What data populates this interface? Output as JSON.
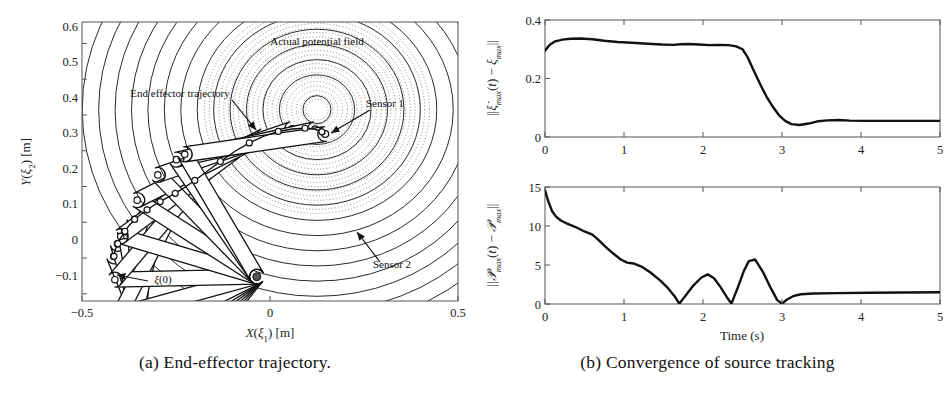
{
  "figure": {
    "panels": [
      {
        "id": "a",
        "caption": "(a)  End-effector trajectory.",
        "chart_index": 0
      },
      {
        "id": "b",
        "caption": "(b)  Convergence of source tracking",
        "chart_index": 1
      }
    ]
  },
  "chart_data": [
    {
      "type": "line",
      "title": "",
      "subtitle": "",
      "xlabel": "X(ξ₁) [m]",
      "ylabel": "Y(ξ₂) [m]",
      "xlim": [
        -0.5,
        0.5
      ],
      "ylim": [
        -0.12,
        0.66
      ],
      "grid": false,
      "legend_position": "none",
      "xticks": [
        -0.5,
        0,
        0.5
      ],
      "xticklabels": [
        "−0.5",
        "0",
        "0.5"
      ],
      "yticks": [
        -0.1,
        0,
        0.1,
        0.2,
        0.3,
        0.4,
        0.5,
        0.6
      ],
      "yticklabels": [
        "−0.1",
        "0",
        "0.1",
        "0.2",
        "0.3",
        "0.4",
        "0.5",
        "0.6"
      ],
      "annotations": [
        {
          "text": "Actual potential field",
          "x": 0.19,
          "y": 0.605
        },
        {
          "text": "End effector trajectory",
          "x": -0.295,
          "y": 0.465
        },
        {
          "text": "Sensor 1",
          "x": 0.175,
          "y": 0.385
        },
        {
          "text": "Sensor 2",
          "x": 0.185,
          "y": 0.075
        },
        {
          "text": "ξ(0)",
          "x": -0.315,
          "y": 0.012
        }
      ],
      "potential_field": {
        "center": [
          0.125,
          0.415
        ],
        "kind": "concentric-contours",
        "n_solid_rings": 13,
        "n_dotted_rings": 22
      },
      "manipulator": {
        "kind": "two-link-planar-snapshots",
        "base": [
          -0.035,
          -0.052
        ],
        "n_snapshots": 13
      },
      "series": [
        {
          "name": "end-effector trajectory",
          "x": [
            -0.415,
            -0.412,
            -0.405,
            -0.396,
            -0.386,
            -0.374,
            -0.36,
            -0.344,
            -0.327,
            -0.31,
            -0.292,
            -0.273,
            -0.252,
            -0.228,
            -0.2,
            -0.168,
            -0.132,
            -0.094,
            -0.055,
            -0.016,
            0.022,
            0.059,
            0.093,
            0.12,
            0.138,
            0.147
          ],
          "y": [
            0.005,
            0.022,
            0.04,
            0.058,
            0.075,
            0.092,
            0.108,
            0.122,
            0.135,
            0.147,
            0.158,
            0.169,
            0.181,
            0.197,
            0.217,
            0.242,
            0.27,
            0.298,
            0.322,
            0.341,
            0.354,
            0.361,
            0.363,
            0.36,
            0.353,
            0.347
          ]
        }
      ]
    },
    {
      "type": "line",
      "title": "",
      "subtitle": "",
      "xlabel": "Time (s)",
      "shared_x": true,
      "grid": false,
      "legend_position": "none",
      "subplots": [
        {
          "ylabel": "||ξ̇ₘₐₓ(t) − ξₘₐₓ||",
          "ylabel_parts": {
            "norm_open": "||",
            "dot_var": "ẞ",
            "var1": "ξ",
            "sub1": "max",
            "arg": "(t)",
            "minus": "−",
            "var2": "ξ",
            "sub2": "max",
            "norm_close": "||"
          },
          "xlim": [
            0,
            5
          ],
          "ylim": [
            0,
            0.4
          ],
          "xticks": [
            0,
            1,
            2,
            3,
            4,
            5
          ],
          "xticklabels": [
            "0",
            "1",
            "2",
            "3",
            "4",
            "5"
          ],
          "yticks": [
            0,
            0.2,
            0.4
          ],
          "yticklabels": [
            "0",
            "0.2",
            "0.4"
          ],
          "x": [
            0.0,
            0.06,
            0.13,
            0.22,
            0.32,
            0.45,
            0.6,
            0.75,
            0.92,
            1.1,
            1.3,
            1.48,
            1.62,
            1.72,
            1.82,
            1.95,
            2.08,
            2.2,
            2.32,
            2.42,
            2.5,
            2.56,
            2.62,
            2.68,
            2.74,
            2.8,
            2.88,
            2.96,
            3.04,
            3.12,
            3.22,
            3.34,
            3.46,
            3.58,
            3.72,
            3.86,
            4.05,
            4.3,
            4.6,
            5.0
          ],
          "y": [
            0.295,
            0.315,
            0.327,
            0.333,
            0.336,
            0.337,
            0.334,
            0.329,
            0.325,
            0.322,
            0.319,
            0.316,
            0.315,
            0.317,
            0.318,
            0.316,
            0.314,
            0.315,
            0.314,
            0.31,
            0.3,
            0.275,
            0.24,
            0.205,
            0.172,
            0.14,
            0.105,
            0.075,
            0.055,
            0.044,
            0.041,
            0.046,
            0.054,
            0.057,
            0.058,
            0.056,
            0.055,
            0.055,
            0.055,
            0.055
          ]
        },
        {
          "ylabel": "||𝒯̇ₘₐₓ(t) − 𝒯ₘₐₓ||",
          "ylabel_parts": {
            "norm_open": "||",
            "var1": "𝒯",
            "sub1": "max",
            "arg": "(t)",
            "minus": "−",
            "var2": "𝒯",
            "sub2": "max",
            "norm_close": "||"
          },
          "xlim": [
            0,
            5
          ],
          "ylim": [
            0,
            15
          ],
          "xticks": [
            0,
            1,
            2,
            3,
            4,
            5
          ],
          "xticklabels": [
            "0",
            "1",
            "2",
            "3",
            "4",
            "5"
          ],
          "yticks": [
            0,
            5,
            10,
            15
          ],
          "yticklabels": [
            "0",
            "5",
            "10",
            "15"
          ],
          "x": [
            0.0,
            0.04,
            0.09,
            0.14,
            0.2,
            0.28,
            0.38,
            0.5,
            0.6,
            0.68,
            0.76,
            0.86,
            0.96,
            1.04,
            1.12,
            1.22,
            1.34,
            1.46,
            1.56,
            1.64,
            1.7,
            1.78,
            1.88,
            1.98,
            2.06,
            2.14,
            2.22,
            2.3,
            2.36,
            2.44,
            2.52,
            2.58,
            2.66,
            2.76,
            2.86,
            2.94,
            3.0,
            3.06,
            3.14,
            3.24,
            3.4,
            3.7,
            4.1,
            4.55,
            5.0
          ],
          "y": [
            14.6,
            13.2,
            11.9,
            11.2,
            10.7,
            10.3,
            9.9,
            9.3,
            8.9,
            8.2,
            7.4,
            6.5,
            5.7,
            5.3,
            5.2,
            4.8,
            4.0,
            3.0,
            2.0,
            1.0,
            0.05,
            1.1,
            2.4,
            3.4,
            3.8,
            3.3,
            2.2,
            0.9,
            0.05,
            2.1,
            4.3,
            5.5,
            5.7,
            4.1,
            2.0,
            0.5,
            0.05,
            0.55,
            1.0,
            1.25,
            1.35,
            1.4,
            1.45,
            1.48,
            1.5
          ]
        }
      ]
    }
  ]
}
